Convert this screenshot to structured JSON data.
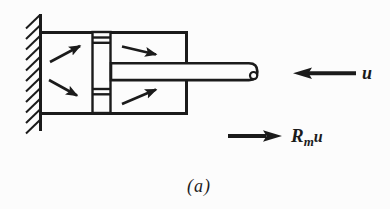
{
  "figure": {
    "colors": {
      "ink": "#1b1b1b",
      "background": "#fcfcfc"
    },
    "labels": {
      "velocity": "u",
      "force_coef": "R",
      "force_sub": "m",
      "force_var": "u"
    },
    "caption": "(a)"
  }
}
